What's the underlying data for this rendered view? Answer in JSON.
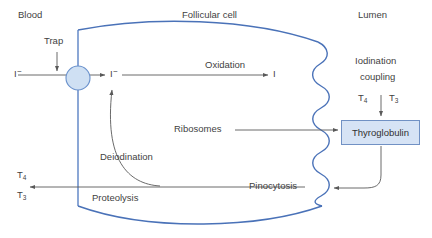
{
  "diagram": {
    "title_regions": {
      "blood": "Blood",
      "follicular_cell": "Follicular cell",
      "lumen": "Lumen"
    },
    "labels": {
      "trap": "Trap",
      "oxidation": "Oxidation",
      "iodide_in": "I",
      "iodide_in_charge": "−",
      "iodide_cell": "I",
      "iodide_cell_charge": "−",
      "iodine_oxidized": "I",
      "iodination": "Iodination",
      "coupling": "coupling",
      "t4_lumen": "T",
      "t4_lumen_sub": "4",
      "t3_lumen": "T",
      "t3_lumen_sub": "3",
      "ribosomes": "Ribosomes",
      "thyroglobulin": "Thyroglobulin",
      "pinocytosis": "Pinocytosis",
      "deiodination": "Deiodination",
      "proteolysis": "Proteolysis",
      "t4_out": "T",
      "t4_out_sub": "4",
      "t3_out": "T",
      "t3_out_sub": "3"
    },
    "colors": {
      "membrane_blue": "#4a72b8",
      "cell_wall_blue": "#5b82c4",
      "arrow_gray": "#595959",
      "text_gray": "#3f3f3f",
      "box_fill": "#d6e3f5",
      "box_border": "#7191c4",
      "trap_circle_fill": "#cfe0f3",
      "trap_circle_border": "#6b92cc",
      "background": "#ffffff"
    }
  }
}
